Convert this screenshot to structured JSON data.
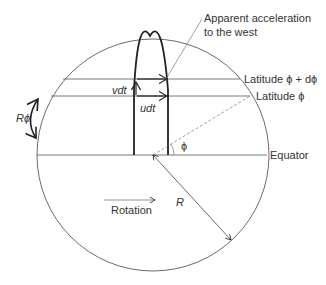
{
  "labels": {
    "apparent_line1": "Apparent acceleration",
    "apparent_line2": "to the west",
    "lat_dphi": "Latitude ϕ + dϕ",
    "lat_phi": "Latitude ϕ",
    "vdt": "vdt",
    "udt": "udt",
    "rphi": "Rϕ",
    "phi": "ϕ",
    "equator": "Equator",
    "rotation": "Rotation",
    "radius": "R"
  }
}
